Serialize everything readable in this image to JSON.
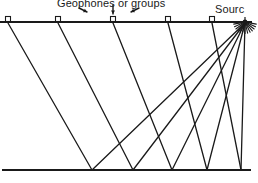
{
  "figure": {
    "kind": "seismic-reflection-raypath-diagram",
    "width": 258,
    "height": 183,
    "background": "#ffffff",
    "ink": "#1a1a1a"
  },
  "labels": {
    "geophones": "Geophones or groups",
    "source": "Sourc"
  },
  "surface": {
    "name": "surface-line",
    "x1": 0,
    "y1": 22,
    "x2": 252,
    "y2": 22,
    "stroke_width": 2.0
  },
  "reflector": {
    "name": "reflector-line",
    "x1": 2,
    "y1": 170,
    "x2": 251,
    "y2": 170,
    "stroke_width": 2.0
  },
  "source_point": {
    "x": 245,
    "y": 22,
    "marker": "burst"
  },
  "geophones": [
    {
      "id": "g1",
      "x": 8,
      "y": 22
    },
    {
      "id": "g2",
      "x": 58,
      "y": 22
    },
    {
      "id": "g3",
      "x": 113,
      "y": 22
    },
    {
      "id": "g4",
      "x": 168,
      "y": 22
    },
    {
      "id": "g5",
      "x": 212,
      "y": 22
    }
  ],
  "geophone_marker": {
    "w": 5,
    "h": 5,
    "fill": "#ffffff",
    "stroke_width": 1.1
  },
  "annotation_arrows": [
    {
      "id": "a1",
      "x1": 79,
      "y1": 8,
      "x2": 87,
      "y2": 12,
      "head": "end"
    },
    {
      "id": "a2",
      "x1": 113,
      "y1": 5,
      "x2": 113,
      "y2": 14,
      "head": "end"
    },
    {
      "id": "a3",
      "x1": 139,
      "y1": 8,
      "x2": 131,
      "y2": 12,
      "head": "end"
    }
  ],
  "reflection_points": [
    {
      "id": "r1",
      "x": 92,
      "y": 170
    },
    {
      "id": "r2",
      "x": 133,
      "y": 170
    },
    {
      "id": "r3",
      "x": 172,
      "y": 170
    },
    {
      "id": "r4",
      "x": 207,
      "y": 170
    },
    {
      "id": "r5",
      "x": 241,
      "y": 170
    }
  ],
  "raypaths": [
    {
      "id": "ray-g1",
      "geophone": "g1",
      "reflection": "r1",
      "down": {
        "x1": 8,
        "y1": 23,
        "x2": 92,
        "y2": 170
      },
      "up": {
        "x1": 92,
        "y1": 170,
        "x2": 245,
        "y2": 23
      }
    },
    {
      "id": "ray-g2",
      "geophone": "g2",
      "reflection": "r2",
      "down": {
        "x1": 58,
        "y1": 23,
        "x2": 133,
        "y2": 170
      },
      "up": {
        "x1": 133,
        "y1": 170,
        "x2": 245,
        "y2": 23
      }
    },
    {
      "id": "ray-g3",
      "geophone": "g3",
      "reflection": "r3",
      "down": {
        "x1": 113,
        "y1": 23,
        "x2": 172,
        "y2": 170
      },
      "up": {
        "x1": 172,
        "y1": 170,
        "x2": 245,
        "y2": 23
      }
    },
    {
      "id": "ray-g4",
      "geophone": "g4",
      "reflection": "r4",
      "down": {
        "x1": 168,
        "y1": 23,
        "x2": 207,
        "y2": 170
      },
      "up": {
        "x1": 207,
        "y1": 170,
        "x2": 245,
        "y2": 23
      }
    },
    {
      "id": "ray-g5",
      "geophone": "g5",
      "reflection": "r5",
      "down": {
        "x1": 212,
        "y1": 23,
        "x2": 241,
        "y2": 170
      },
      "up": {
        "x1": 241,
        "y1": 170,
        "x2": 245,
        "y2": 23
      }
    }
  ],
  "ray_stroke_width": 1.3
}
